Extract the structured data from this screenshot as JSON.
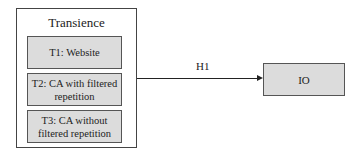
{
  "diagram": {
    "group": {
      "title": "Transience",
      "items": [
        {
          "label": "T1: Website"
        },
        {
          "label": "T2: CA with filtered repetition"
        },
        {
          "label": "T3: CA without filtered repetition"
        }
      ]
    },
    "edge": {
      "label": "H1",
      "from": "Transience",
      "to": "IO"
    },
    "target": {
      "label": "IO"
    },
    "colors": {
      "box_fill": "#dcdcdc",
      "border": "#444444",
      "line": "#222222"
    }
  }
}
